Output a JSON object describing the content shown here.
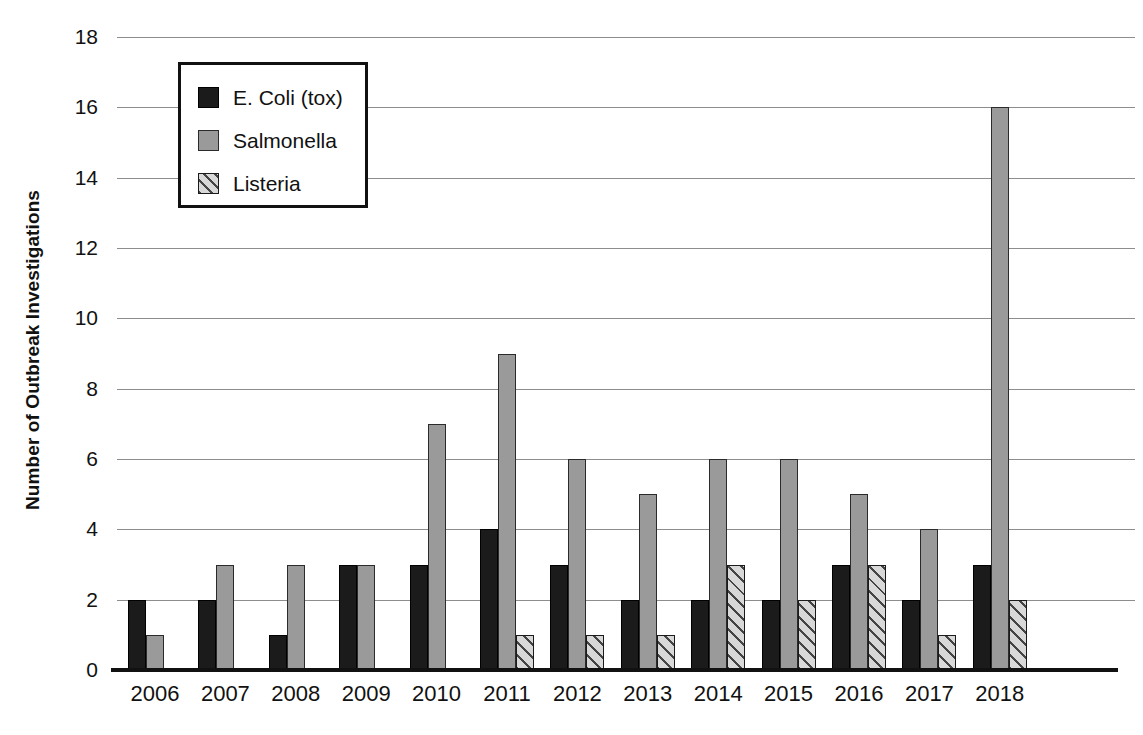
{
  "chart_data": {
    "type": "bar",
    "title": "",
    "xlabel": "",
    "ylabel": "Number of Outbreak Investigations",
    "ylim": [
      0,
      18
    ],
    "ytick_step": 2,
    "yticks": [
      "18",
      "16",
      "14",
      "12",
      "10",
      "8",
      "6",
      "4",
      "2",
      "0"
    ],
    "grid": true,
    "legend_position": "top-left-inside",
    "categories": [
      "2006",
      "2007",
      "2008",
      "2009",
      "2010",
      "2011",
      "2012",
      "2013",
      "2014",
      "2015",
      "2016",
      "2017",
      "2018"
    ],
    "series": [
      {
        "name": "E. Coli (tox)",
        "swatch": "solid-black-square-icon",
        "color": "#1b1b1b",
        "values": [
          2,
          2,
          1,
          3,
          3,
          4,
          3,
          2,
          2,
          2,
          3,
          2,
          3
        ]
      },
      {
        "name": "Salmonella",
        "swatch": "solid-gray-square-icon",
        "color": "#9a9a9a",
        "values": [
          1,
          3,
          3,
          3,
          7,
          9,
          6,
          5,
          6,
          6,
          5,
          4,
          16
        ]
      },
      {
        "name": "Listeria",
        "swatch": "hatched-square-icon",
        "color": "#d8d8d8",
        "values": [
          0,
          0,
          0,
          0,
          0,
          1,
          1,
          1,
          3,
          2,
          3,
          1,
          2
        ]
      }
    ]
  }
}
